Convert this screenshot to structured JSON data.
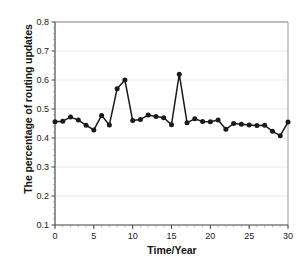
{
  "chart_data": {
    "type": "line",
    "title": "",
    "xlabel": "Time/Year",
    "ylabel": "The percentage of routing updates",
    "xlim": [
      0,
      30
    ],
    "ylim": [
      0.1,
      0.8
    ],
    "grid": true,
    "legend": null,
    "marker": "filled-circle",
    "line_color": "#1a1a1a",
    "marker_color": "#1a1a1a",
    "background_color": "#ffffff",
    "xticks": [
      0,
      5,
      10,
      15,
      20,
      25,
      30
    ],
    "xtick_labels": [
      "0",
      "5",
      "10",
      "15",
      "20",
      "25",
      "30"
    ],
    "xminor_tick_step": 1,
    "yticks": [
      0.1,
      0.2,
      0.3,
      0.4,
      0.5,
      0.6,
      0.7,
      0.8
    ],
    "ytick_labels": [
      "0.1",
      "0.2",
      "0.3",
      "0.4",
      "0.5",
      "0.6",
      "0.7",
      "0.8"
    ],
    "x": [
      0,
      1,
      2,
      3,
      4,
      5,
      6,
      7,
      8,
      9,
      10,
      11,
      12,
      13,
      14,
      15,
      16,
      17,
      18,
      19,
      20,
      21,
      22,
      23,
      24,
      25,
      26,
      27,
      28,
      29,
      30
    ],
    "values": [
      0.456,
      0.458,
      0.472,
      0.462,
      0.444,
      0.428,
      0.478,
      0.445,
      0.57,
      0.6,
      0.46,
      0.464,
      0.479,
      0.474,
      0.47,
      0.446,
      0.62,
      0.453,
      0.466,
      0.457,
      0.456,
      0.462,
      0.43,
      0.45,
      0.447,
      0.445,
      0.443,
      0.444,
      0.423,
      0.408,
      0.455
    ],
    "series_name": "percentage of routing updates",
    "annotations": []
  }
}
